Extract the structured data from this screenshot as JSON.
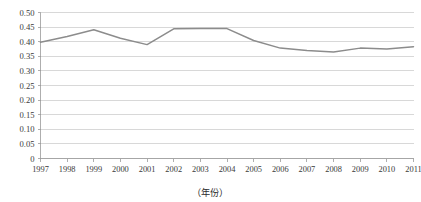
{
  "chart_data": {
    "type": "line",
    "title": "",
    "subtitle": "",
    "xlabel": "（年份）",
    "ylabel": "",
    "categories": [
      "1997",
      "1998",
      "1999",
      "2000",
      "2001",
      "2002",
      "2003",
      "2004",
      "2005",
      "2006",
      "2007",
      "2008",
      "2009",
      "2010",
      "2011"
    ],
    "x": [
      1997,
      1998,
      1999,
      2000,
      2001,
      2002,
      2003,
      2004,
      2005,
      2006,
      2007,
      2008,
      2009,
      2010,
      2011
    ],
    "series": [
      {
        "name": "",
        "color": "#8c8c8c",
        "values": [
          0.398,
          0.418,
          0.441,
          0.412,
          0.39,
          0.444,
          0.445,
          0.445,
          0.404,
          0.378,
          0.37,
          0.365,
          0.378,
          0.375,
          0.383
        ]
      }
    ],
    "ylim": [
      0,
      0.5
    ],
    "xlim": [
      1997,
      2011
    ],
    "ytick_values": [
      0,
      0.05,
      0.1,
      0.15,
      0.2,
      0.25,
      0.3,
      0.35,
      0.4,
      0.45,
      0.5
    ],
    "ytick_labels": [
      "0",
      "0.05",
      "0.10",
      "0.15",
      "0.20",
      "0.25",
      "0.30",
      "0.35",
      "0.40",
      "0.45",
      "0.50"
    ],
    "grid": true,
    "grid_axis": "y",
    "legend": false,
    "legend_position": "none",
    "markers": false,
    "annotations": []
  },
  "axes": {
    "x_axis_title": "（年份）",
    "y_axis_title": ""
  },
  "style": {
    "line_color": "#8c8c8c",
    "grid_color": "#c8c8c8",
    "axis_color": "#9a9a9a",
    "background": "#ffffff",
    "text_color": "#2b2b2b"
  }
}
